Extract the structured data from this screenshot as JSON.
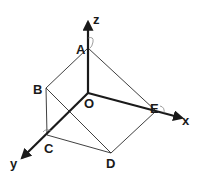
{
  "diagram": {
    "type": "3d-coordinate-solid",
    "axes": {
      "x": {
        "label": "x"
      },
      "y": {
        "label": "y"
      },
      "z": {
        "label": "z"
      }
    },
    "points": {
      "O": {
        "label": "O"
      },
      "A": {
        "label": "A"
      },
      "B": {
        "label": "B"
      },
      "C": {
        "label": "C"
      },
      "D": {
        "label": "D"
      },
      "E": {
        "label": "E"
      }
    },
    "edges": [
      "A-B",
      "A-E",
      "B-C",
      "B-D",
      "C-D",
      "D-E",
      "O-A",
      "O-C",
      "O-E"
    ],
    "right_angle_marks": [
      "A",
      "C",
      "E"
    ]
  }
}
